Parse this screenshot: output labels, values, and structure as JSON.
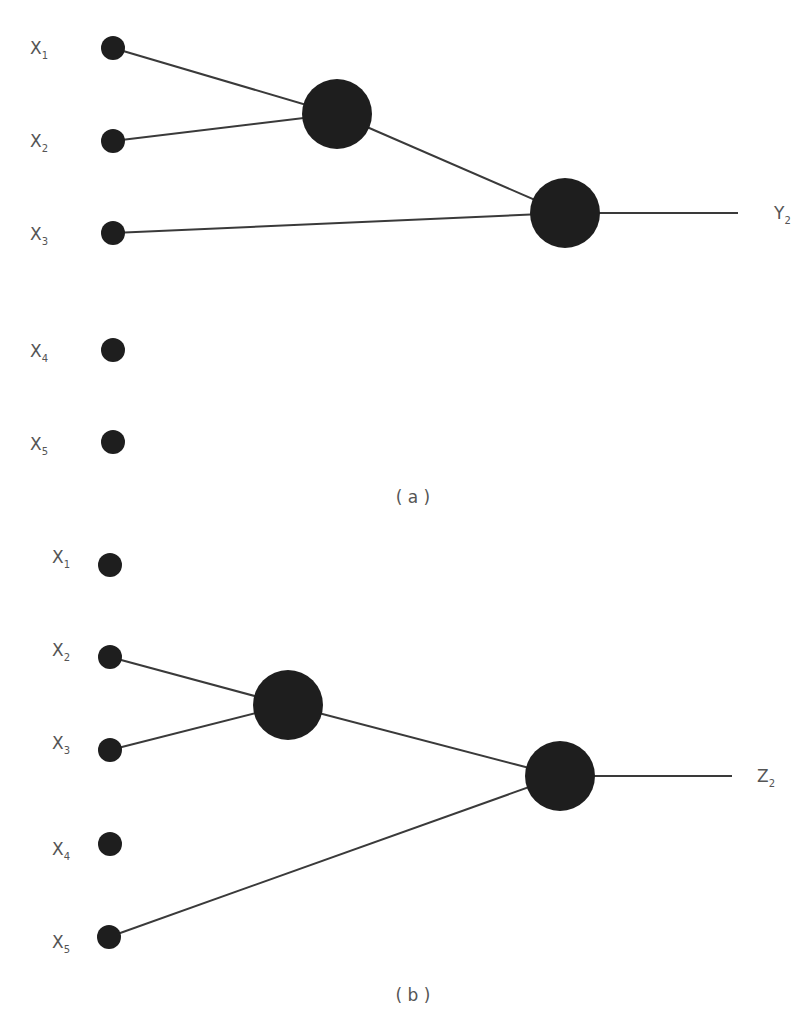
{
  "panels": [
    {
      "caption": "( a )",
      "inputs": [
        {
          "label": "X",
          "sub": "1",
          "x": 113,
          "y": 48
        },
        {
          "label": "X",
          "sub": "2",
          "x": 113,
          "y": 141
        },
        {
          "label": "X",
          "sub": "3",
          "x": 113,
          "y": 233
        },
        {
          "label": "X",
          "sub": "4",
          "x": 113,
          "y": 350
        },
        {
          "label": "X",
          "sub": "5",
          "x": 113,
          "y": 442
        }
      ],
      "hidden": {
        "x": 337,
        "y": 114,
        "r": 35
      },
      "output": {
        "x": 565,
        "y": 213,
        "r": 35
      },
      "output_label": {
        "label": "Y",
        "sub": "2"
      },
      "edges": [
        [
          "X1",
          "hidden"
        ],
        [
          "X2",
          "hidden"
        ],
        [
          "hidden",
          "output"
        ],
        [
          "X3",
          "output"
        ]
      ]
    },
    {
      "caption": "( b )",
      "inputs": [
        {
          "label": "X",
          "sub": "1",
          "x": 110,
          "y": 565
        },
        {
          "label": "X",
          "sub": "2",
          "x": 110,
          "y": 657
        },
        {
          "label": "X",
          "sub": "3",
          "x": 110,
          "y": 750
        },
        {
          "label": "X",
          "sub": "4",
          "x": 110,
          "y": 844
        },
        {
          "label": "X",
          "sub": "5",
          "x": 109,
          "y": 937
        }
      ],
      "hidden": {
        "x": 288,
        "y": 705,
        "r": 35
      },
      "output": {
        "x": 560,
        "y": 776,
        "r": 35
      },
      "output_label": {
        "label": "Z",
        "sub": "2"
      },
      "edges": [
        [
          "X2",
          "hidden"
        ],
        [
          "X3",
          "hidden"
        ],
        [
          "hidden",
          "output"
        ],
        [
          "X5",
          "output"
        ]
      ]
    }
  ]
}
